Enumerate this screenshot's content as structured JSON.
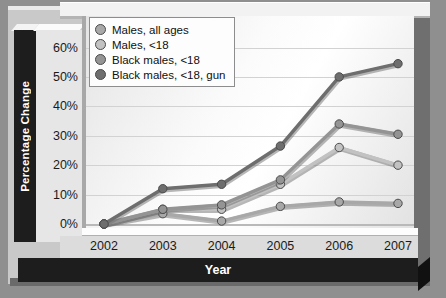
{
  "chart_data": {
    "type": "line",
    "title": "",
    "xlabel": "Year",
    "ylabel": "Percentage Change",
    "categories": [
      "2002",
      "2003",
      "2004",
      "2005",
      "2006",
      "2007"
    ],
    "x": [
      2002,
      2003,
      2004,
      2005,
      2006,
      2007
    ],
    "ylim": [
      0,
      65
    ],
    "yticks": [
      0,
      10,
      20,
      30,
      40,
      50,
      60
    ],
    "ytick_labels": [
      "0%",
      "10%",
      "20%",
      "30%",
      "40%",
      "50%",
      "60%"
    ],
    "grid": true,
    "legend_position": "top-left",
    "series": [
      {
        "name": "Males, all ages",
        "color": "#a8a8a8",
        "values": [
          0,
          3.5,
          1,
          6,
          7.5,
          7
        ]
      },
      {
        "name": "Males, <18",
        "color": "#c2c2c2",
        "values": [
          0,
          5,
          5,
          13.5,
          26,
          20
        ]
      },
      {
        "name": "Black males, <18",
        "color": "#949494",
        "values": [
          0,
          5,
          6.5,
          15,
          34,
          30.5
        ]
      },
      {
        "name": "Black males, <18, gun",
        "color": "#6e6e6e",
        "values": [
          0,
          12,
          13.5,
          26.5,
          50,
          54.5
        ]
      }
    ]
  },
  "axes": {
    "y_title": "Percentage Change",
    "x_title": "Year"
  }
}
